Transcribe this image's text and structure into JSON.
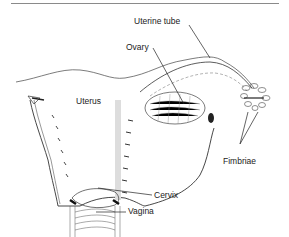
{
  "figure": {
    "type": "anatomical-diagram",
    "labels": [
      {
        "id": "uterine-tube",
        "text": "Uterine tube"
      },
      {
        "id": "ovary",
        "text": "Ovary"
      },
      {
        "id": "uterus",
        "text": "Uterus"
      },
      {
        "id": "fimbriae",
        "text": "Fimbriae"
      },
      {
        "id": "cervix",
        "text": "Cervix"
      },
      {
        "id": "vagina",
        "text": "Vagina"
      }
    ],
    "colors": {
      "line": "#333333",
      "shading": "#555555",
      "rule": "#8a8a8a",
      "background": "#ffffff"
    }
  }
}
